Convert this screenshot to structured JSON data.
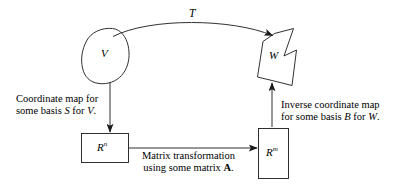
{
  "diagram": {
    "type": "commutative-diagram",
    "background_color": "#ffffff",
    "stroke_color": "#1a1a1a",
    "nodes": {
      "domain_blob": {
        "label": "V",
        "shape": "rounded-blob"
      },
      "codomain_blob": {
        "label": "W",
        "shape": "zigzag-polygon"
      },
      "left_box": {
        "label_base": "R",
        "label_exponent": "n",
        "shape": "rectangle"
      },
      "right_box": {
        "label_base": "R",
        "label_exponent": "m",
        "shape": "rectangle"
      }
    },
    "arrows": {
      "top_arc": {
        "label": "T",
        "from": "V",
        "to": "W"
      },
      "left_down": {
        "line1": "Coordinate map for",
        "line2_pre": "some basis ",
        "line2_basis": "S",
        "line2_mid": " for ",
        "line2_space": "V",
        "line2_end": "."
      },
      "bottom_right": {
        "line1": "Matrix transformation",
        "line2_pre": "using some matrix ",
        "line2_matrix": "A",
        "line2_end": "."
      },
      "right_up": {
        "line1": "Inverse coordinate map",
        "line2_pre": "for some basis ",
        "line2_basis": "B",
        "line2_mid": " for ",
        "line2_space": "W",
        "line2_end": "."
      }
    }
  }
}
